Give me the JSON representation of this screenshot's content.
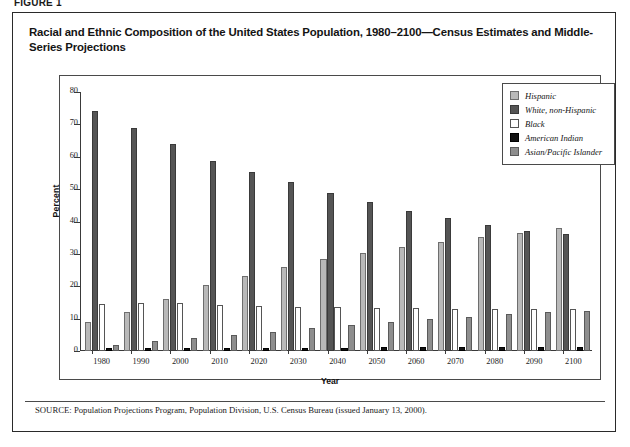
{
  "figure": {
    "label": "FIGURE 1",
    "title": "Racial and Ethnic Composition of the United States Population, 1980–2100—Census Estimates and Middle-Series Projections",
    "source_prefix": "SOURCE:",
    "source_text": " Population Projections Program, Population Division,  U.S. Census Bureau (issued January 13, 2000)."
  },
  "legend": {
    "position": "top-right",
    "items": [
      {
        "label": "Hispanic",
        "color": "#b9b9b9",
        "swatch": "s0"
      },
      {
        "label": "White, non-Hispanic",
        "color": "#555555",
        "swatch": "s1"
      },
      {
        "label": "Black",
        "color": "#ffffff",
        "swatch": "s2"
      },
      {
        "label": "American Indian",
        "color": "#111111",
        "swatch": "s3"
      },
      {
        "label": "Asian/Pacific Islander",
        "color": "#8e8e8e",
        "swatch": "s4"
      }
    ]
  },
  "chart_data": {
    "type": "bar",
    "title": "Racial and Ethnic Composition of the United States Population, 1980–2100—Census Estimates and Middle-Series Projections",
    "xlabel": "Year",
    "ylabel": "Percent",
    "ylim": [
      0,
      80
    ],
    "yticks": [
      0,
      10,
      20,
      30,
      40,
      50,
      60,
      70,
      80
    ],
    "grid": false,
    "legend_position": "top-right",
    "categories": [
      "1980",
      "1990",
      "2000",
      "2010",
      "2020",
      "2030",
      "2040",
      "2050",
      "2060",
      "2070",
      "2080",
      "2090",
      "2100"
    ],
    "series": [
      {
        "name": "Hispanic",
        "color": "#b9b9b9",
        "values": [
          9.0,
          12.0,
          16.0,
          20.5,
          23.2,
          25.8,
          28.4,
          30.4,
          32.2,
          33.8,
          35.2,
          36.5,
          38.0
        ]
      },
      {
        "name": "White, non-Hispanic",
        "color": "#555555",
        "values": [
          74.0,
          69.0,
          64.0,
          58.8,
          55.3,
          52.2,
          48.8,
          45.9,
          43.4,
          41.1,
          38.8,
          37.0,
          36.0
        ]
      },
      {
        "name": "Black",
        "color": "#ffffff",
        "values": [
          14.5,
          14.7,
          14.7,
          14.1,
          14.0,
          13.7,
          13.5,
          13.3,
          13.2,
          13.1,
          13.0,
          12.9,
          12.9
        ]
      },
      {
        "name": "American Indian",
        "color": "#111111",
        "values": [
          1.0,
          1.0,
          1.0,
          1.0,
          1.0,
          1.0,
          1.0,
          1.1,
          1.1,
          1.1,
          1.1,
          1.1,
          1.1
        ]
      },
      {
        "name": "Asian/Pacific Islander",
        "color": "#8e8e8e",
        "values": [
          1.8,
          3.0,
          4.1,
          5.0,
          6.0,
          7.0,
          8.0,
          9.0,
          9.9,
          10.6,
          11.4,
          12.0,
          12.4
        ]
      }
    ]
  }
}
